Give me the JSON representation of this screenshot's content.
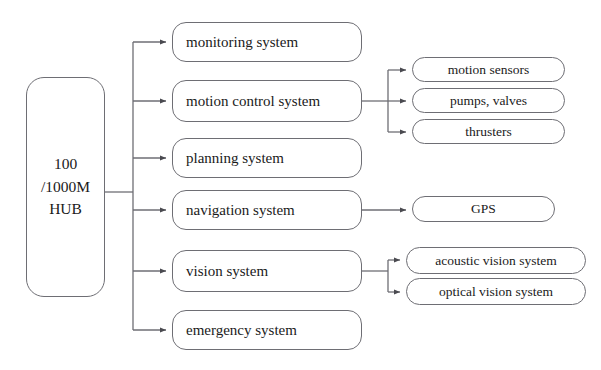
{
  "diagram": {
    "background_color": "#ffffff",
    "line_color": "#6e6e74",
    "text_color": "#1a1a1a",
    "hub": {
      "name": "hub-node",
      "lines": [
        "100",
        "/1000M",
        "HUB"
      ],
      "full_label": "100 /1000M HUB",
      "x": 26,
      "y": 77,
      "w": 79,
      "h": 220
    },
    "subsystems": [
      {
        "key": "monitoring",
        "label": "monitoring system",
        "x": 172,
        "y": 22,
        "w": 190,
        "h": 40
      },
      {
        "key": "motion",
        "label": "motion control system",
        "x": 172,
        "y": 80,
        "w": 190,
        "h": 42
      },
      {
        "key": "planning",
        "label": "planning system",
        "x": 172,
        "y": 138,
        "w": 190,
        "h": 40
      },
      {
        "key": "navigation",
        "label": "navigation system",
        "x": 172,
        "y": 190,
        "w": 190,
        "h": 40
      },
      {
        "key": "vision",
        "label": "vision system",
        "x": 172,
        "y": 250,
        "w": 190,
        "h": 42
      },
      {
        "key": "emergency",
        "label": "emergency system",
        "x": 172,
        "y": 310,
        "w": 190,
        "h": 40
      }
    ],
    "devices": [
      {
        "key": "motion-sensors",
        "label": "motion sensors",
        "parent": "motion",
        "x": 412,
        "y": 57,
        "w": 153,
        "h": 25
      },
      {
        "key": "pumps-valves",
        "label": "pumps, valves",
        "parent": "motion",
        "x": 412,
        "y": 88,
        "w": 153,
        "h": 25
      },
      {
        "key": "thrusters",
        "label": "thrusters",
        "parent": "motion",
        "x": 412,
        "y": 119,
        "w": 153,
        "h": 25
      },
      {
        "key": "gps",
        "label": "GPS",
        "parent": "navigation",
        "x": 412,
        "y": 196,
        "w": 143,
        "h": 26
      },
      {
        "key": "acoustic-vision",
        "label": "acoustic vision system",
        "parent": "vision",
        "x": 406,
        "y": 247,
        "w": 180,
        "h": 27
      },
      {
        "key": "optical-vision",
        "label": "optical vision system",
        "parent": "vision",
        "x": 406,
        "y": 278,
        "w": 180,
        "h": 27
      }
    ]
  }
}
